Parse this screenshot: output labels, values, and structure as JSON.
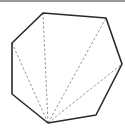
{
  "diagram": {
    "type": "heptagon-triangulation",
    "shape": "heptagon",
    "vertex_count": 7,
    "vertices": [
      [
        48,
        123
      ],
      [
        12,
        94
      ],
      [
        12,
        43
      ],
      [
        43,
        13
      ],
      [
        106,
        18
      ],
      [
        122,
        64
      ],
      [
        96,
        115
      ]
    ],
    "diagonals_from_vertex": 0,
    "diagonal_targets": [
      2,
      3,
      4,
      5
    ],
    "colors": {
      "outline": "#2a2a2a",
      "diagonal": "#8a8a8a",
      "topbar": "#9a9a9a",
      "background": "#ffffff"
    }
  }
}
